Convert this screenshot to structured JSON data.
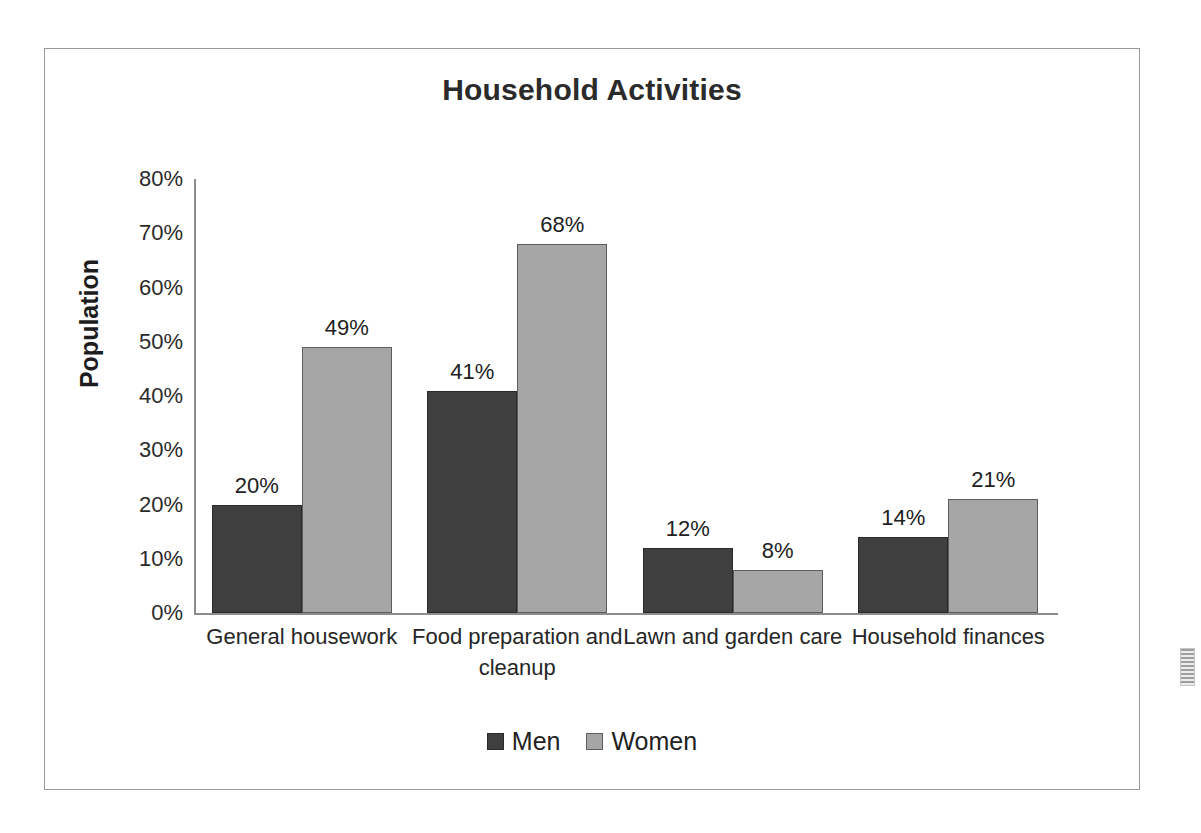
{
  "chart_data": {
    "type": "bar",
    "title": "Household Activities",
    "xlabel": "",
    "ylabel": "Population",
    "ylim": [
      0,
      80
    ],
    "ytick_labels": [
      "80%",
      "70%",
      "60%",
      "50%",
      "40%",
      "30%",
      "20%",
      "10%",
      "0%"
    ],
    "ytick_values": [
      80,
      70,
      60,
      50,
      40,
      30,
      20,
      10,
      0
    ],
    "grid": false,
    "legend_position": "bottom",
    "categories": [
      "General housework",
      "Food preparation and cleanup",
      "Lawn and garden care",
      "Household finances"
    ],
    "series": [
      {
        "name": "Men",
        "color": "#3f3f3f",
        "values": [
          20,
          41,
          12,
          14
        ],
        "labels": [
          "20%",
          "41%",
          "12%",
          "14%"
        ]
      },
      {
        "name": "Women",
        "color": "#a6a6a6",
        "values": [
          49,
          68,
          8,
          21
        ],
        "labels": [
          "49%",
          "68%",
          "8%",
          "21%"
        ]
      }
    ]
  },
  "legend": {
    "items": [
      {
        "label": "Men"
      },
      {
        "label": "Women"
      }
    ]
  },
  "artifact": {
    "name": "scan-artifact"
  }
}
